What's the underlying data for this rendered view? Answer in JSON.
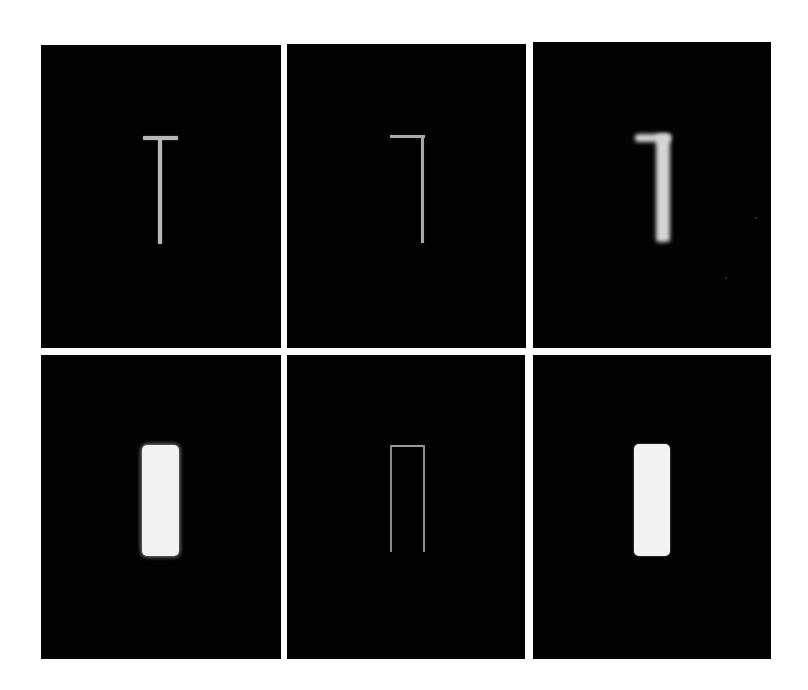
{
  "figure": {
    "background": "#ffffff",
    "panel_background": "#020202",
    "layout": {
      "rows": 2,
      "columns": 3
    },
    "panels": [
      {
        "id": "top-left",
        "row": 1,
        "col": 1,
        "stimulus": "T-shape (thin horizontal bar centered on thin vertical stem)",
        "brightness": "medium gray"
      },
      {
        "id": "top-middle",
        "row": 1,
        "col": 2,
        "stimulus": "inverted-L / 7-shape (thin bar with stem at right end)",
        "brightness": "medium gray"
      },
      {
        "id": "top-right",
        "row": 1,
        "col": 3,
        "stimulus": "blurred thick 7-shape",
        "brightness": "light gray, blurred"
      },
      {
        "id": "bottom-left",
        "row": 2,
        "col": 1,
        "stimulus": "filled vertical rectangle",
        "brightness": "near white, soft edges"
      },
      {
        "id": "bottom-middle",
        "row": 2,
        "col": 2,
        "stimulus": "rectangle outline open at bottom (inverted U)",
        "brightness": "dim gray lines"
      },
      {
        "id": "bottom-right",
        "row": 2,
        "col": 3,
        "stimulus": "filled vertical rectangle",
        "brightness": "near white, sharp edges"
      }
    ]
  }
}
